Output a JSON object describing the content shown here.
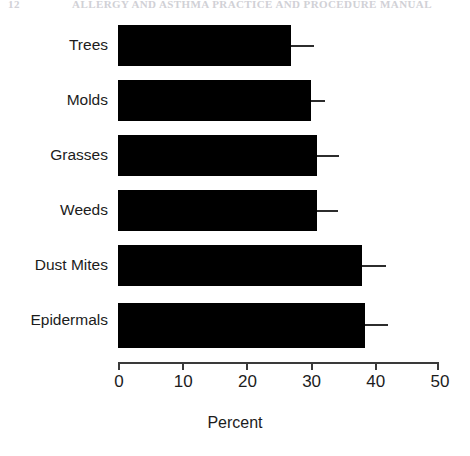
{
  "page_header": {
    "folio": "12",
    "running_head": "ALLERGY AND ASTHMA PRACTICE AND PROCEDURE MANUAL"
  },
  "chart_data": {
    "type": "bar",
    "orientation": "horizontal",
    "title": "",
    "subtitle": "",
    "xlabel": "Percent",
    "ylabel": "",
    "categories": [
      "Trees",
      "Molds",
      "Grasses",
      "Weeds",
      "Dust Mites",
      "Epidermals"
    ],
    "values": [
      27,
      30,
      31,
      31,
      38,
      38.5
    ],
    "error_high": [
      30.5,
      32.3,
      34.4,
      34.2,
      41.7,
      42
    ],
    "series": [
      {
        "name": "Percent positive",
        "values": [
          27,
          30,
          31,
          31,
          38,
          38.5
        ]
      }
    ],
    "xlim": [
      0,
      50
    ],
    "xticks": [
      0,
      10,
      20,
      30,
      40,
      50
    ],
    "xtick_labels": [
      "0",
      "10",
      "20",
      "30",
      "40",
      "50"
    ],
    "grid": false,
    "legend": "none",
    "bar_color": "#000000",
    "error_bar_color": "#2c2c2c",
    "error_bar_style": "upper-whisker-only"
  }
}
